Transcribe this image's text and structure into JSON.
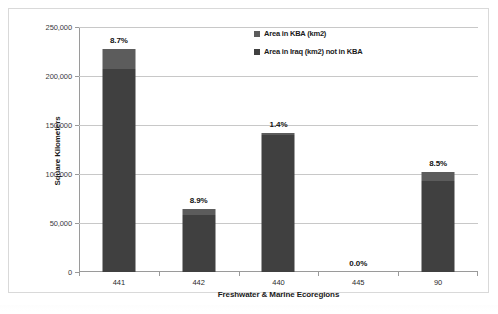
{
  "chart_data": {
    "type": "bar",
    "subtype": "stacked-column",
    "title": "",
    "xlabel": "Freshwater & Marine Ecoregions",
    "ylabel": "Square Kilometers",
    "categories": [
      "441",
      "442",
      "440",
      "445",
      "90"
    ],
    "ylim": [
      0,
      250000
    ],
    "ytick_values": [
      0,
      50000,
      100000,
      150000,
      200000,
      250000
    ],
    "ytick_labels": [
      "0",
      "50,000",
      "100,000",
      "150,000",
      "200,000",
      "250,000"
    ],
    "grid": true,
    "legend_position": "top-right-inside",
    "series": [
      {
        "name": "Area in Iraq (km2) not in KBA",
        "color": "#404040",
        "values": [
          207000,
          58500,
          140000,
          0,
          93000
        ]
      },
      {
        "name": "Area in KBA (km2)",
        "color": "#5c5c5c",
        "values": [
          21000,
          5700,
          2000,
          0,
          8700
        ]
      }
    ],
    "totals": [
      228000,
      64200,
      142000,
      0,
      101700
    ],
    "point_labels": [
      "8.7%",
      "8.9%",
      "1.4%",
      "0.0%",
      "8.5%"
    ]
  },
  "legend": {
    "items": [
      {
        "label": "Area in KBA (km2)",
        "color": "#5c5c5c"
      },
      {
        "label": "Area in Iraq (km2) not in KBA",
        "color": "#404040"
      }
    ]
  },
  "axes": {
    "y_title": "Square Kilometers",
    "x_title": "Freshwater & Marine Ecoregions"
  }
}
